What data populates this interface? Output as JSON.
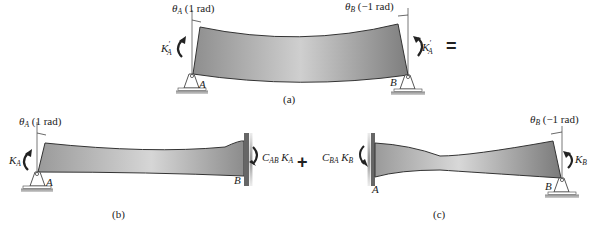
{
  "figure": {
    "panel_a": {
      "caption": "(a)",
      "theta_a_label": "θ",
      "theta_a_sub": "A",
      "theta_a_value": " (1 rad)",
      "theta_b_label": "θ",
      "theta_b_sub": "B",
      "theta_b_value": " (−1 rad)",
      "moment_left_label": "K",
      "moment_left_sup": "′",
      "moment_left_sub": "A",
      "moment_right_label": "K",
      "moment_right_sup": "′",
      "moment_right_sub": "A",
      "support_left_label": "A",
      "support_right_label": "B",
      "equals": "="
    },
    "panel_b": {
      "caption": "(b)",
      "theta_label": "θ",
      "theta_sub": "A",
      "theta_value": " (1 rad)",
      "moment_left_label": "K",
      "moment_left_sub": "A",
      "moment_right_c": "C",
      "moment_right_c_sub": "AB",
      "moment_right_k": " K",
      "moment_right_k_sub": "A",
      "support_left_label": "A",
      "support_right_label": "B"
    },
    "operator_plus": "+",
    "panel_c": {
      "caption": "(c)",
      "theta_label": "θ",
      "theta_sub": "B",
      "theta_value": " (−1 rad)",
      "moment_left_c": "C",
      "moment_left_c_sub": "BA",
      "moment_left_k": " K",
      "moment_left_k_sub": "B",
      "moment_right_label": "K",
      "moment_right_sub": "B",
      "support_left_label": "A",
      "support_right_label": "B"
    },
    "colors": {
      "beam_fill_dark": "#8a8a8a",
      "beam_fill_light": "#d4d4d4",
      "outline": "#333333",
      "wall": "#7a7a7a"
    }
  }
}
